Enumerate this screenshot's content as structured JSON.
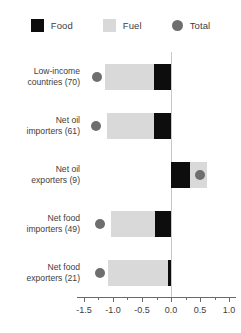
{
  "legend": {
    "items": [
      {
        "label": "Food",
        "icon": "square-swatch-icon",
        "color": "#0d0d0d",
        "shape": "square"
      },
      {
        "label": "Fuel",
        "icon": "square-swatch-icon",
        "color": "#d9d9d9",
        "shape": "square"
      },
      {
        "label": "Total",
        "icon": "circle-marker-icon",
        "color": "#6e6e6e",
        "shape": "circle"
      }
    ]
  },
  "axis": {
    "tick_labels": [
      "-1.5",
      "-1.0",
      "-0.5",
      "0.0",
      "0.5",
      "1.0"
    ],
    "tick_values": [
      -1.5,
      -1.0,
      -0.5,
      0.0,
      0.5,
      1.0
    ],
    "minor_count_between": 1,
    "xmin": -1.62,
    "xmax": 1.12
  },
  "chart_data": {
    "type": "bar",
    "orientation": "horizontal",
    "stacked": true,
    "title": "",
    "subtitle": "",
    "xlabel": "",
    "ylabel": "",
    "xlim": [
      -1.62,
      1.12
    ],
    "grid": false,
    "legend_position": "top-center",
    "categories": [
      "Low-income\ncountries (70)",
      "Net oil\nimporters (61)",
      "Net oil\nexporters (9)",
      "Net food\nimporters (49)",
      "Net food\nexporters (21)"
    ],
    "series": [
      {
        "name": "Food",
        "color": "#0d0d0d",
        "values": [
          -0.29,
          -0.3,
          0.33,
          -0.28,
          -0.05
        ]
      },
      {
        "name": "Fuel",
        "color": "#d9d9d9",
        "values": [
          -0.84,
          -0.8,
          0.29,
          -0.75,
          -1.03
        ]
      }
    ],
    "markers": [
      {
        "name": "Total",
        "color": "#6e6e6e",
        "shape": "circle",
        "values": [
          -1.28,
          -1.3,
          0.5,
          -1.22,
          -1.22
        ]
      }
    ],
    "rows": [
      {
        "label": "Low-income\ncountries (70)",
        "food_start": -0.29,
        "food_end": 0.0,
        "fuel_start": -1.13,
        "fuel_end": -0.29,
        "total": -1.28
      },
      {
        "label": "Net oil\nimporters (61)",
        "food_start": -0.3,
        "food_end": 0.0,
        "fuel_start": -1.1,
        "fuel_end": -0.3,
        "total": -1.3
      },
      {
        "label": "Net oil\nexporters (9)",
        "food_start": 0.0,
        "food_end": 0.33,
        "fuel_start": 0.33,
        "fuel_end": 0.62,
        "total": 0.5
      },
      {
        "label": "Net food\nimporters (49)",
        "food_start": -0.28,
        "food_end": 0.0,
        "fuel_start": -1.03,
        "fuel_end": -0.28,
        "total": -1.22
      },
      {
        "label": "Net food\nexporters (21)",
        "food_start": -0.05,
        "food_end": 0.0,
        "fuel_start": -1.08,
        "fuel_end": -0.05,
        "total": -1.22
      }
    ]
  }
}
